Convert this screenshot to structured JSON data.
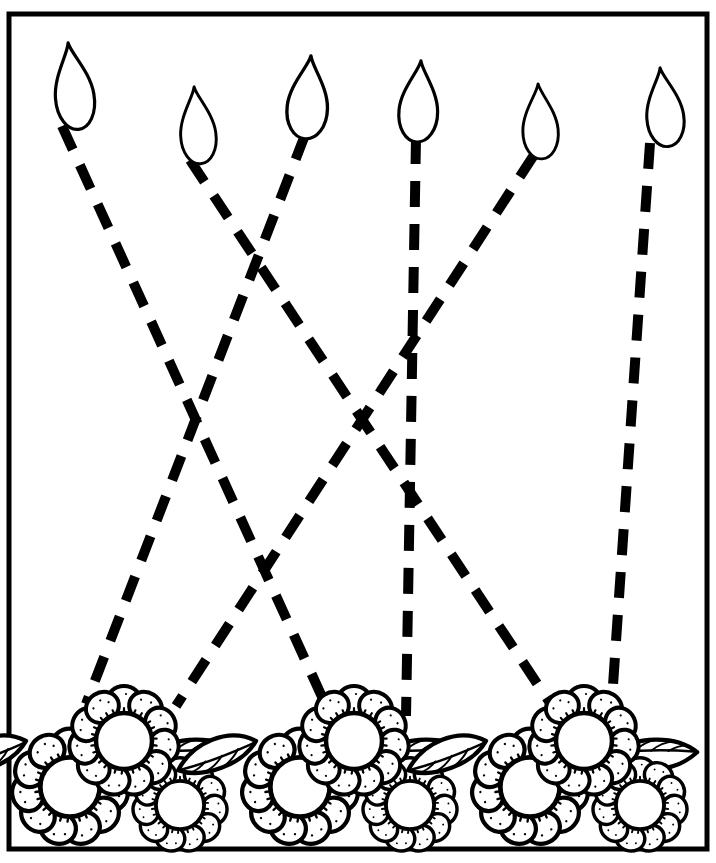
{
  "page": {
    "background_color": "#ffffff",
    "ink_color": "#000000",
    "width": 716,
    "height": 863
  },
  "border": {
    "name": "page-border-frame",
    "x": 9,
    "y": 14,
    "width": 698,
    "height": 835,
    "stroke_width": 5,
    "color": "#000000"
  },
  "flames": [
    {
      "id": "flame-1",
      "label": "Flame 1",
      "tip_x": 68,
      "tip_y": 42,
      "width": 46,
      "height": 88,
      "lean": -7,
      "base_x": 62,
      "base_y": 126
    },
    {
      "id": "flame-2",
      "label": "Flame 2",
      "tip_x": 194,
      "tip_y": 86,
      "width": 42,
      "height": 78,
      "lean": -5,
      "base_x": 190,
      "base_y": 160
    },
    {
      "id": "flame-3",
      "label": "Flame 3",
      "tip_x": 311,
      "tip_y": 55,
      "width": 48,
      "height": 84,
      "lean": 4,
      "base_x": 305,
      "base_y": 135
    },
    {
      "id": "flame-4",
      "label": "Flame 4",
      "tip_x": 421,
      "tip_y": 60,
      "width": 46,
      "height": 82,
      "lean": 3,
      "base_x": 416,
      "base_y": 138
    },
    {
      "id": "flame-5",
      "label": "Flame 5",
      "tip_x": 538,
      "tip_y": 83,
      "width": 42,
      "height": 76,
      "lean": -3,
      "base_x": 534,
      "base_y": 155
    },
    {
      "id": "flame-6",
      "label": "Flame 6",
      "tip_x": 660,
      "tip_y": 67,
      "width": 44,
      "height": 80,
      "lean": -6,
      "base_x": 650,
      "base_y": 143
    }
  ],
  "flower_clusters": [
    {
      "id": "flower-cluster-1",
      "label": "Flower Cluster 1",
      "center_x": 118,
      "center_y": 775,
      "scale": 1.0
    },
    {
      "id": "flower-cluster-2",
      "label": "Flower Cluster 2",
      "center_x": 348,
      "center_y": 775,
      "scale": 1.0
    },
    {
      "id": "flower-cluster-3",
      "label": "Flower Cluster 3",
      "center_x": 578,
      "center_y": 775,
      "scale": 1.0
    }
  ],
  "dashed_paths": [
    {
      "id": "dashed-path-1",
      "label": "Dashed trace line from Flame 1 to Flower Cluster 2",
      "from": "flame-1",
      "to": "flower-cluster-2",
      "x1": 62,
      "y1": 126,
      "x2": 328,
      "y2": 710,
      "dash": "26 17",
      "stroke_width": 10
    },
    {
      "id": "dashed-path-2",
      "label": "Dashed trace line from Flame 2 to Flower Cluster 3",
      "from": "flame-2",
      "to": "flower-cluster-3",
      "x1": 190,
      "y1": 160,
      "x2": 552,
      "y2": 706,
      "dash": "26 17",
      "stroke_width": 10
    },
    {
      "id": "dashed-path-3",
      "label": "Dashed trace line from Flame 3 to Flower Cluster 1",
      "from": "flame-3",
      "to": "flower-cluster-1",
      "x1": 305,
      "y1": 135,
      "x2": 86,
      "y2": 704,
      "dash": "26 17",
      "stroke_width": 10
    },
    {
      "id": "dashed-path-4",
      "label": "Dashed trace line from Flame 4 to Flower Cluster 2",
      "from": "flame-4",
      "to": "flower-cluster-2",
      "x1": 416,
      "y1": 138,
      "x2": 406,
      "y2": 716,
      "dash": "26 17",
      "stroke_width": 10
    },
    {
      "id": "dashed-path-5",
      "label": "Dashed trace line from Flame 5 to Flower Cluster 1",
      "from": "flame-5",
      "to": "flower-cluster-1",
      "x1": 534,
      "y1": 155,
      "x2": 176,
      "y2": 706,
      "dash": "26 17",
      "stroke_width": 10
    },
    {
      "id": "dashed-path-6",
      "label": "Dashed trace line from Flame 6 to Flower Cluster 3",
      "from": "flame-6",
      "to": "flower-cluster-3",
      "x1": 650,
      "y1": 143,
      "x2": 612,
      "y2": 700,
      "dash": "26 17",
      "stroke_width": 10
    }
  ]
}
